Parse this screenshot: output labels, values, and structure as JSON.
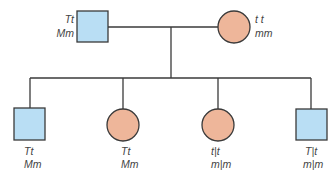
{
  "diagram": {
    "type": "pedigree",
    "colors": {
      "male_fill": "#b9def4",
      "female_fill": "#eeb69a",
      "stroke": "#3a3a3a",
      "label": "#444444"
    },
    "parents": {
      "father": {
        "sex": "male",
        "genotype_line1": "Tt",
        "genotype_line2": "Mm"
      },
      "mother": {
        "sex": "female",
        "genotype_line1": "t t",
        "genotype_line2": "mm"
      }
    },
    "children": [
      {
        "sex": "male",
        "genotype_line1": "Tt",
        "genotype_line2": "Mm"
      },
      {
        "sex": "female",
        "genotype_line1": "Tt",
        "genotype_line2": "Mm"
      },
      {
        "sex": "female",
        "genotype_line1": "t|t",
        "genotype_line2": "m|m"
      },
      {
        "sex": "male",
        "genotype_line1": "T|t",
        "genotype_line2": "m|m"
      }
    ]
  }
}
